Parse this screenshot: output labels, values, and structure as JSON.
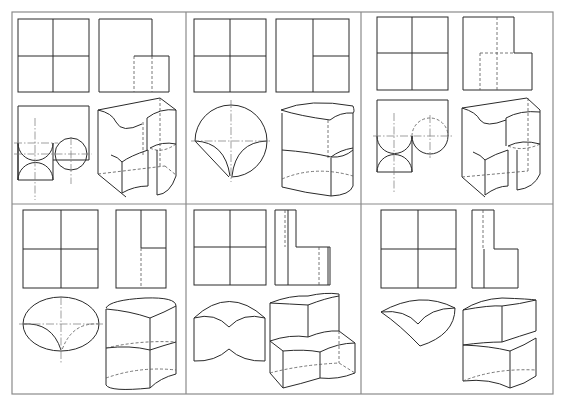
{
  "figure": {
    "frame": {
      "x": 12,
      "y": 12,
      "width": 541,
      "height": 382,
      "col_dividers": [
        186,
        361
      ],
      "row_divider": 204
    },
    "caption": "",
    "panels": [
      {
        "id": "A",
        "row": 1,
        "col": 1,
        "views": [
          "front-view",
          "side-view",
          "top-view",
          "isometric-view"
        ],
        "top_view_shape": "two tangent half-circles with side circle",
        "iso_shape": "block with concave cylindrical cuts"
      },
      {
        "id": "B",
        "row": 1,
        "col": 2,
        "views": [
          "front-view",
          "side-view",
          "top-view",
          "isometric-view"
        ],
        "top_view_shape": "circle with cusp cut",
        "iso_shape": "two-tier rounded block"
      },
      {
        "id": "C",
        "row": 1,
        "col": 3,
        "views": [
          "front-view",
          "side-view",
          "top-view",
          "isometric-view"
        ],
        "top_view_shape": "half-circles with side circle (hidden)",
        "iso_shape": "block with concave cylindrical cuts"
      },
      {
        "id": "D",
        "row": 2,
        "col": 1,
        "views": [
          "front-view",
          "side-view",
          "top-view",
          "isometric-view"
        ],
        "top_view_shape": "ellipse with cusp cut",
        "iso_shape": "two-tier elliptic cylinder"
      },
      {
        "id": "E",
        "row": 2,
        "col": 2,
        "views": [
          "front-view",
          "side-view",
          "top-view",
          "isometric-view"
        ],
        "top_view_shape": "bow-tie arched outline",
        "iso_shape": "stepped wavy block"
      },
      {
        "id": "F",
        "row": 2,
        "col": 3,
        "views": [
          "front-view",
          "side-view",
          "top-view",
          "isometric-view"
        ],
        "top_view_shape": "curved sector with cusp",
        "iso_shape": "two-tier curved block"
      }
    ]
  },
  "line_styles": {
    "solid": "#2a2a2a",
    "hidden": "#555555",
    "centerline": "#777777",
    "frame": "#8a8a8a"
  }
}
